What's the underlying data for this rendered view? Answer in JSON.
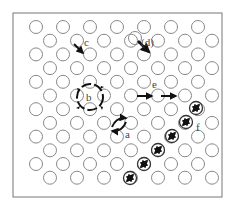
{
  "figure": {
    "frame": {
      "x": 13,
      "y": 13,
      "width": 209,
      "height": 184,
      "stroke": "#777777"
    },
    "lattice": {
      "rows": 12,
      "row_spacing": 13.7,
      "first_row_y": 27,
      "col_spacing": 27,
      "even_row_start_x": 36,
      "odd_row_start_x": 50,
      "per_row": 7,
      "radius": 6.5,
      "stroke": "#888888"
    },
    "mechanisms": [
      {
        "id": "a",
        "label": "a",
        "name": "direct-exchange"
      },
      {
        "id": "b",
        "label": "b",
        "name": "ring-rotation"
      },
      {
        "id": "c",
        "label": "c",
        "name": "vacancy"
      },
      {
        "id": "d",
        "label": "d",
        "name": "interstitial"
      },
      {
        "id": "e",
        "label": "e",
        "name": "interstitialcy"
      },
      {
        "id": "f",
        "label": "f",
        "name": "crowdion"
      }
    ],
    "labels": {
      "a": "a",
      "b": "b",
      "c": "c",
      "d": "(d)",
      "e": "e",
      "f": "f"
    },
    "arrow_color": "#111111"
  }
}
